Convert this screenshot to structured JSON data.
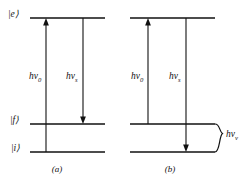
{
  "figure": {
    "type": "energy-level-diagram",
    "line_color": "#111111",
    "background_color": "#ffffff",
    "panels": [
      {
        "id": "a",
        "caption": "(a)",
        "levels": [
          {
            "id": "e",
            "label": "|e⟩",
            "label_text": "|e)"
          },
          {
            "id": "f",
            "label": "|f⟩",
            "label_text": "|f)"
          },
          {
            "id": "i",
            "label": "|i⟩",
            "label_text": "|i)"
          }
        ],
        "transitions": [
          {
            "id": "absorption",
            "direction": "up",
            "from": "i",
            "to": "e",
            "label_base": "hν",
            "label_sub": "0"
          },
          {
            "id": "stokes-emission",
            "direction": "down",
            "from": "e",
            "to": "f",
            "label_base": "hν",
            "label_sub": "s"
          }
        ]
      },
      {
        "id": "b",
        "caption": "(b)",
        "levels": [
          {
            "id": "e",
            "label": "",
            "label_text": ""
          },
          {
            "id": "f",
            "label": "",
            "label_text": ""
          },
          {
            "id": "i",
            "label": "",
            "label_text": ""
          }
        ],
        "transitions": [
          {
            "id": "absorption",
            "direction": "up",
            "from": "f",
            "to": "e",
            "label_base": "hν",
            "label_sub": "0"
          },
          {
            "id": "anti-stokes-emission",
            "direction": "down",
            "from": "e",
            "to": "i",
            "label_base": "hν",
            "label_sub": "s"
          }
        ],
        "brace": {
          "id": "vibrational-splitting",
          "label_base": "hν",
          "label_sub": "v",
          "spans": [
            "f",
            "i"
          ]
        }
      }
    ]
  }
}
